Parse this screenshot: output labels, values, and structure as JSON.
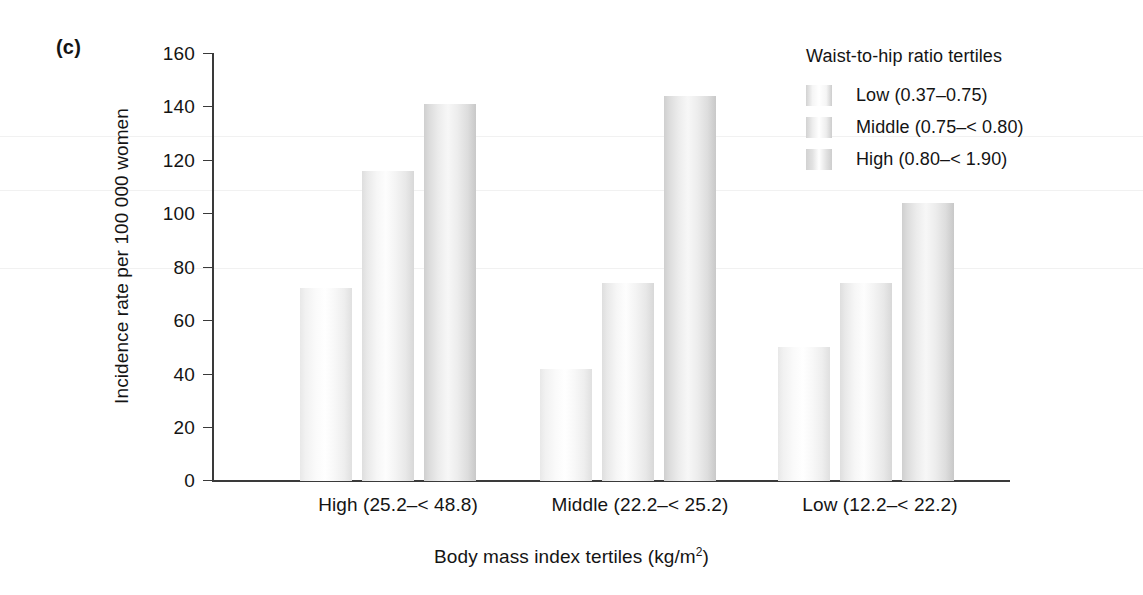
{
  "panel": {
    "label": "(c)"
  },
  "chart_data": {
    "type": "bar",
    "title": "",
    "panel_label": "(c)",
    "xlabel": "Body mass index tertiles (kg/m2)",
    "xlabel_base": "Body mass index tertiles (kg/m",
    "xlabel_sup": "2",
    "xlabel_tail": ")",
    "ylabel": "Incidence rate per 100 000 women",
    "ylim": [
      0,
      160
    ],
    "ytick_step": 20,
    "yticks": [
      "160",
      "140",
      "120",
      "100",
      "80",
      "60",
      "40",
      "20",
      "0"
    ],
    "ytick_values": [
      160,
      140,
      120,
      100,
      80,
      60,
      40,
      20,
      0
    ],
    "grid": false,
    "legend_position": "top-right",
    "legend_title": "Waist-to-hip ratio tertiles",
    "categories": [
      "High (25.2–< 48.8)",
      "Middle (22.2–< 25.2)",
      "Low (12.2–< 22.2)"
    ],
    "series": [
      {
        "name": "Low (0.37–0.75)",
        "values": [
          72,
          42,
          50
        ],
        "color": "#f5f5f5"
      },
      {
        "name": "Middle (0.75–< 0.80)",
        "values": [
          116,
          74,
          74
        ],
        "color": "#ededed"
      },
      {
        "name": "High (0.80–< 1.90)",
        "values": [
          141,
          144,
          104
        ],
        "color": "#e2e2e2"
      }
    ]
  },
  "legend": {
    "title": "Waist-to-hip ratio tertiles",
    "items": [
      {
        "label": "Low (0.37–0.75)"
      },
      {
        "label": "Middle (0.75–< 0.80)"
      },
      {
        "label": "High (0.80–< 1.90)"
      }
    ]
  }
}
